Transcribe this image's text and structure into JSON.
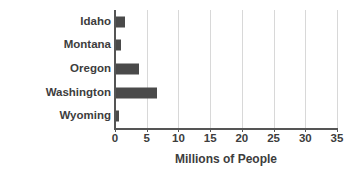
{
  "chart_data": {
    "type": "bar",
    "orientation": "horizontal",
    "title": "",
    "subtitle": "",
    "xlabel": "Millions of People",
    "ylabel": "",
    "categories": [
      "Idaho",
      "Montana",
      "Oregon",
      "Washington",
      "Wyoming"
    ],
    "values": [
      1.6,
      1.0,
      3.8,
      6.7,
      0.6
    ],
    "series": [
      {
        "name": "Population",
        "values": [
          1.6,
          1.0,
          3.8,
          6.7,
          0.6
        ]
      }
    ],
    "xlim": [
      0,
      35
    ],
    "ylim": [
      0,
      5
    ],
    "xticks": [
      0,
      5,
      10,
      15,
      20,
      25,
      30,
      35
    ],
    "xtick_labels": [
      "0",
      "5",
      "10",
      "15",
      "20",
      "25",
      "30",
      "35"
    ],
    "grid": "vertical",
    "legend": "none",
    "annotations": []
  },
  "style": {
    "bar_color": "#4a4a4a",
    "grid_color": "#d8d8d8",
    "axis_color": "#555555",
    "text_color": "#3d3d3d",
    "background": "#ffffff"
  }
}
